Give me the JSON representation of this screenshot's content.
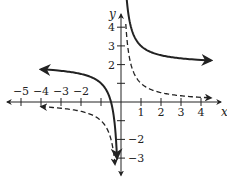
{
  "chart_data": {
    "type": "line",
    "title": "",
    "xlabel": "x",
    "ylabel": "y",
    "xlim": [
      -5.5,
      4.8
    ],
    "ylim": [
      -3.6,
      4.8
    ],
    "grid": false,
    "legend": "none",
    "x_ticks": [
      -5,
      -4,
      -3,
      -2,
      -1,
      1,
      2,
      3,
      4
    ],
    "x_tick_labels": [
      {
        "value": -5,
        "label": "−5"
      },
      {
        "value": -4,
        "label": "−4"
      },
      {
        "value": -3,
        "label": "−3"
      },
      {
        "value": -2,
        "label": "−2"
      },
      {
        "value": 1,
        "label": "1"
      },
      {
        "value": 2,
        "label": "2"
      },
      {
        "value": 3,
        "label": "3"
      },
      {
        "value": 4,
        "label": "4"
      }
    ],
    "y_ticks": [
      -3,
      -2,
      -1,
      1,
      2,
      3,
      4
    ],
    "y_tick_labels": [
      {
        "value": 4,
        "label": "4"
      },
      {
        "value": 3,
        "label": "3"
      },
      {
        "value": 2,
        "label": "2"
      },
      {
        "value": -2,
        "label": "−2"
      },
      {
        "value": -3,
        "label": "−3"
      }
    ],
    "series": [
      {
        "name": "y = 1/x + 2",
        "style": "solid",
        "color": "#222222",
        "branches": [
          {
            "x_from": -4.0,
            "x_to": -0.2,
            "arrow_start": true,
            "arrow_end": true
          },
          {
            "x_from": 0.21,
            "x_to": 4.5,
            "arrow_start": true,
            "arrow_end": true
          }
        ]
      },
      {
        "name": "y = 1/x",
        "style": "dashed",
        "color": "#222222",
        "branches": [
          {
            "x_from": -4.0,
            "x_to": -0.3,
            "arrow_start": true,
            "arrow_end": true
          },
          {
            "x_from": 0.24,
            "x_to": 4.5,
            "arrow_start": false,
            "arrow_end": true
          }
        ]
      }
    ]
  }
}
